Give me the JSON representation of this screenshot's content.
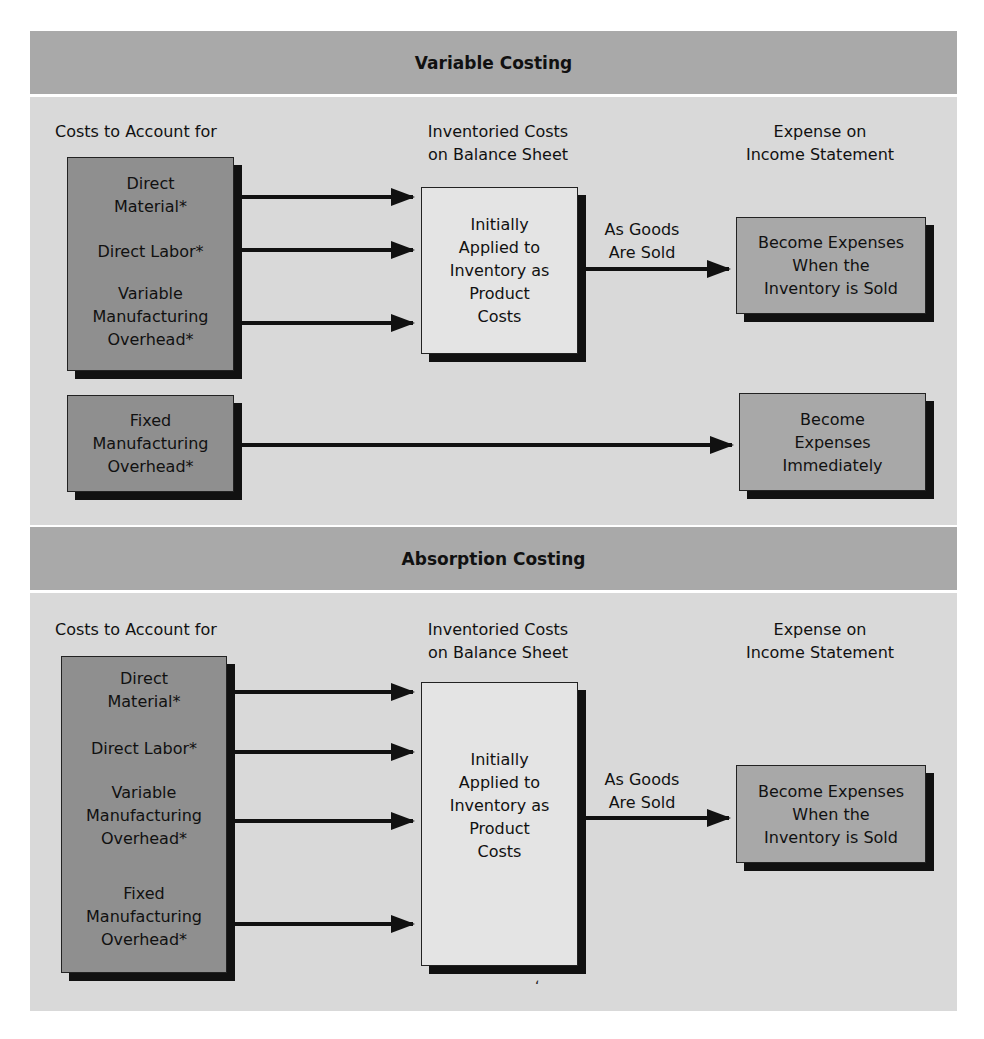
{
  "variable_costing": {
    "title": "Variable Costing",
    "col_costs": "Costs to Account for",
    "col_inventoried_1": "Inventoried Costs",
    "col_inventoried_2": "on Balance Sheet",
    "col_expense_1": "Expense on",
    "col_expense_2": "Income Statement",
    "product_costs": {
      "direct_material_1": "Direct",
      "direct_material_2": "Material*",
      "direct_labor": "Direct Labor*",
      "variable_moh_1": "Variable",
      "variable_moh_2": "Manufacturing",
      "variable_moh_3": "Overhead*"
    },
    "inventory_box": [
      "Initially",
      "Applied to",
      "Inventory as",
      "Product",
      "Costs"
    ],
    "goods_sold_label_1": "As Goods",
    "goods_sold_label_2": "Are Sold",
    "expense_box": [
      "Become Expenses",
      "When the",
      "Inventory is Sold"
    ],
    "fixed_moh": [
      "Fixed",
      "Manufacturing",
      "Overhead*"
    ],
    "immediate_expense_box": [
      "Become",
      "Expenses",
      "Immediately"
    ]
  },
  "absorption_costing": {
    "title": "Absorption Costing",
    "col_costs": "Costs to Account for",
    "col_inventoried_1": "Inventoried Costs",
    "col_inventoried_2": "on Balance Sheet",
    "col_expense_1": "Expense on",
    "col_expense_2": "Income Statement",
    "product_costs": {
      "direct_material_1": "Direct",
      "direct_material_2": "Material*",
      "direct_labor": "Direct Labor*",
      "variable_moh_1": "Variable",
      "variable_moh_2": "Manufacturing",
      "variable_moh_3": "Overhead*",
      "fixed_moh_1": "Fixed",
      "fixed_moh_2": "Manufacturing",
      "fixed_moh_3": "Overhead*"
    },
    "inventory_box": [
      "Initially",
      "Applied to",
      "Inventory as",
      "Product",
      "Costs"
    ],
    "goods_sold_label_1": "As Goods",
    "goods_sold_label_2": "Are Sold",
    "expense_box": [
      "Become Expenses",
      "When the",
      "Inventory is Sold"
    ]
  },
  "stray_mark": "ʻ",
  "colors": {
    "header_bg": "#a9a9a9",
    "panel_bg": "#d9d9d9",
    "cost_box_bg": "#8f8f8f",
    "expense_box_bg": "#a8a8a8",
    "inventory_box_bg": "#e4e4e4",
    "shadow": "#111111"
  }
}
